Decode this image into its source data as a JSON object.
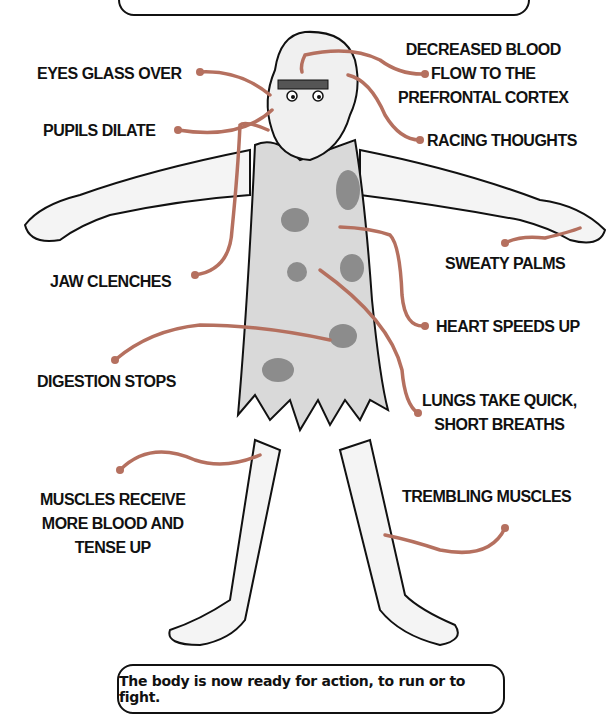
{
  "diagram": {
    "top_box_text": "",
    "bottom_box_text": "The body is now ready for action, to run or to fight.",
    "line_color": "#b5705f",
    "figure_fill": "#d9d9d9",
    "spot_color": "#8c8c8c",
    "labels": {
      "eyes": "EYES GLASS OVER",
      "pupils": "PUPILS DILATE",
      "blood_flow": "DECREASED BLOOD\nFLOW TO THE\nPREFRONTAL CORTEX",
      "racing": "RACING THOUGHTS",
      "jaw": "JAW CLENCHES",
      "sweaty": "SWEATY PALMS",
      "heart": "HEART SPEEDS UP",
      "digestion": "DIGESTION STOPS",
      "lungs": "LUNGS TAKE QUICK,\nSHORT BREATHS",
      "muscles_receive": "MUSCLES RECEIVE\nMORE BLOOD AND\nTENSE UP",
      "trembling": "TREMBLING MUSCLES"
    }
  }
}
